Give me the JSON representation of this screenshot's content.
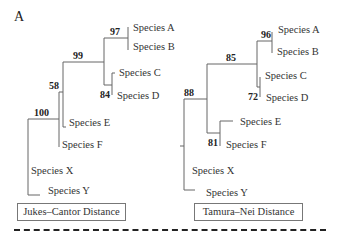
{
  "panel_label": "A",
  "left_tree": {
    "method": "Jukes–Cantor Distance",
    "species": [
      "Species A",
      "Species B",
      "Species C",
      "Species D",
      "Species E",
      "Species F",
      "Species X",
      "Species Y"
    ],
    "bootstrap": {
      "AB": "97",
      "ABCD": "99",
      "CD": "84",
      "ABCDEF": "58",
      "root": "100"
    }
  },
  "right_tree": {
    "method": "Tamura–Nei Distance",
    "species": [
      "Species A",
      "Species B",
      "Species C",
      "Species D",
      "Species E",
      "Species F",
      "Species X",
      "Species Y"
    ],
    "bootstrap": {
      "AB": "96",
      "ABCD": "85",
      "CD": "72",
      "ABCDEF": "88",
      "EF": "81"
    }
  }
}
